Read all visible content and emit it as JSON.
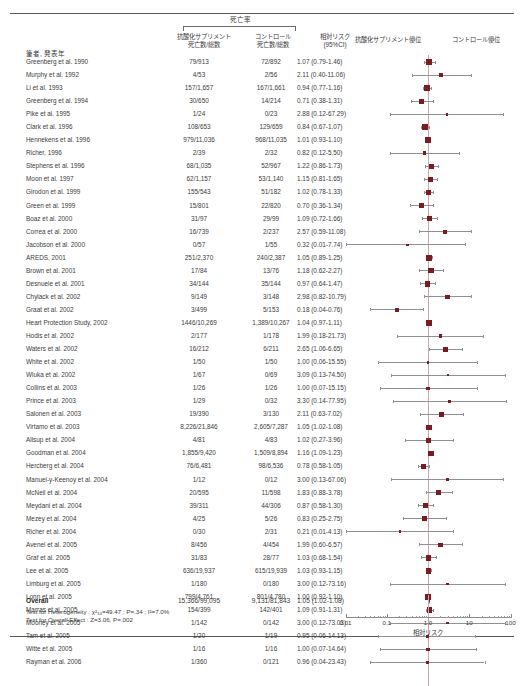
{
  "header": {
    "mortality_group": "死亡率",
    "col_supplement": "抗酸化サプリメント\n死亡数/総数",
    "col_supplement_line1": "抗酸化サプリメント",
    "col_supplement_line2": "死亡数/総数",
    "col_control_line1": "コントロール",
    "col_control_line2": "死亡数/総数",
    "col_rr_line1": "相対リスク",
    "col_rr_line2": "(95%CI)",
    "col_favors_supplement": "抗酸化サプリメント優位",
    "col_favors_control": "コントロール優位",
    "col_author": "筆者, 発表年"
  },
  "overall": {
    "label": "Overall",
    "supplement": "15,366/99,095",
    "control": "9,131/81,843",
    "rr_text": "1.05 (1.02-1.08)",
    "rr": 1.05,
    "lo": 1.02,
    "hi": 1.08
  },
  "tests": {
    "heterogeneity": "Test for Heterogeneity : χ²₃₄=49.47 ; P=.34 ; I²=7.0%",
    "overall_effect": "Test for Overall Effect : Z=3.06, P=.002"
  },
  "axis": {
    "title": "相対リスク",
    "ticks": [
      "0.01",
      "0.1",
      "1.0",
      "10",
      "100"
    ],
    "min": 0.01,
    "max": 100
  },
  "colors": {
    "marker": "#7a1b22",
    "ci_line": "#8e9296",
    "zero_line": "#c9a9ab",
    "text": "#3c3c3c",
    "rule": "#5a5a5a"
  },
  "chart_data": {
    "type": "forest",
    "title": "死亡率",
    "xlabel": "相対リスク",
    "xscale": "log",
    "xlim": [
      0.01,
      100
    ],
    "reference_line": 1.0,
    "columns": [
      "筆者, 発表年",
      "抗酸化サプリメント 死亡数/総数",
      "コントロール 死亡数/総数",
      "相対リスク (95%CI)"
    ],
    "studies": [
      {
        "author": "Greenberg et al. 1990",
        "supplement": "79/913",
        "control": "72/892",
        "rr_text": "1.07 (0.79-1.46)",
        "rr": 1.07,
        "lo": 0.79,
        "hi": 1.46
      },
      {
        "author": "Murphy et al. 1992",
        "supplement": "4/53",
        "control": "2/56",
        "rr_text": "2.11 (0.40-11.06)",
        "rr": 2.11,
        "lo": 0.4,
        "hi": 11.06
      },
      {
        "author": "Li et al. 1993",
        "supplement": "157/1,657",
        "control": "167/1,661",
        "rr_text": "0.94 (0.77-1.16)",
        "rr": 0.94,
        "lo": 0.77,
        "hi": 1.16
      },
      {
        "author": "Greenberg et al. 1994",
        "supplement": "30/650",
        "control": "14/214",
        "rr_text": "0.71 (0.38-1.31)",
        "rr": 0.71,
        "lo": 0.38,
        "hi": 1.31
      },
      {
        "author": "Pike et al. 1995",
        "supplement": "1/24",
        "control": "0/23",
        "rr_text": "2.88 (0.12-67.29)",
        "rr": 2.88,
        "lo": 0.12,
        "hi": 67.29
      },
      {
        "author": "Clark et al. 1996",
        "supplement": "108/653",
        "control": "129/659",
        "rr_text": "0.84 (0.67-1.07)",
        "rr": 0.84,
        "lo": 0.67,
        "hi": 1.07
      },
      {
        "author": "Hennekens et al. 1996",
        "supplement": "979/11,036",
        "control": "968/11,035",
        "rr_text": "1.01 (0.93-1.10)",
        "rr": 1.01,
        "lo": 0.93,
        "hi": 1.1
      },
      {
        "author": "Richer, 1996",
        "supplement": "2/39",
        "control": "2/32",
        "rr_text": "0.82 (0.12-5.50)",
        "rr": 0.82,
        "lo": 0.12,
        "hi": 5.5
      },
      {
        "author": "Stephens et al. 1996",
        "supplement": "68/1,035",
        "control": "52/967",
        "rr_text": "1.22 (0.86-1.73)",
        "rr": 1.22,
        "lo": 0.86,
        "hi": 1.73
      },
      {
        "author": "Moon et al. 1997",
        "supplement": "62/1,157",
        "control": "53/1,140",
        "rr_text": "1.15 (0.81-1.65)",
        "rr": 1.15,
        "lo": 0.81,
        "hi": 1.65
      },
      {
        "author": "Girodon et al. 1999",
        "supplement": "155/543",
        "control": "51/182",
        "rr_text": "1.02 (0.78-1.33)",
        "rr": 1.02,
        "lo": 0.78,
        "hi": 1.33
      },
      {
        "author": "Green et al. 1999",
        "supplement": "15/801",
        "control": "22/820",
        "rr_text": "0.70 (0.36-1.34)",
        "rr": 0.7,
        "lo": 0.36,
        "hi": 1.34
      },
      {
        "author": "Boaz et al. 2000",
        "supplement": "31/97",
        "control": "29/99",
        "rr_text": "1.09 (0.72-1.66)",
        "rr": 1.09,
        "lo": 0.72,
        "hi": 1.66
      },
      {
        "author": "Correa et al. 2000",
        "supplement": "16/739",
        "control": "2/237",
        "rr_text": "2.57 (0.59-11.08)",
        "rr": 2.57,
        "lo": 0.59,
        "hi": 11.08
      },
      {
        "author": "Jacobson et al. 2000",
        "supplement": "0/57",
        "control": "1/55",
        "rr_text": "0.32 (0.01-7.74)",
        "rr": 0.32,
        "lo": 0.01,
        "hi": 7.74
      },
      {
        "author": "AREDS, 2001",
        "supplement": "251/2,370",
        "control": "240/2,387",
        "rr_text": "1.05 (0.89-1.25)",
        "rr": 1.05,
        "lo": 0.89,
        "hi": 1.25
      },
      {
        "author": "Brown et al. 2001",
        "supplement": "17/84",
        "control": "13/76",
        "rr_text": "1.18 (0.62-2.27)",
        "rr": 1.18,
        "lo": 0.62,
        "hi": 2.27
      },
      {
        "author": "Desnuele et al. 2001",
        "supplement": "34/144",
        "control": "35/144",
        "rr_text": "0.97 (0.64-1.47)",
        "rr": 0.97,
        "lo": 0.64,
        "hi": 1.47
      },
      {
        "author": "Chylack et al. 2002",
        "supplement": "9/149",
        "control": "3/148",
        "rr_text": "2.98 (0.82-10.79)",
        "rr": 2.98,
        "lo": 0.82,
        "hi": 10.79
      },
      {
        "author": "Graat et al. 2002",
        "supplement": "3/499",
        "control": "5/153",
        "rr_text": "0.18 (0.04-0.76)",
        "rr": 0.18,
        "lo": 0.04,
        "hi": 0.76
      },
      {
        "author": "Heart Protection Study, 2002",
        "supplement": "1446/10,269",
        "control": "1,389/10,267",
        "rr_text": "1.04 (0.97-1.11)",
        "rr": 1.04,
        "lo": 0.97,
        "hi": 1.11
      },
      {
        "author": "Hodis et al. 2002",
        "supplement": "2/177",
        "control": "1/178",
        "rr_text": "1.99 (0.18-21.73)",
        "rr": 1.99,
        "lo": 0.18,
        "hi": 21.73
      },
      {
        "author": "Waters et al. 2002",
        "supplement": "16/212",
        "control": "6/211",
        "rr_text": "2.65 (1.06-6.65)",
        "rr": 2.65,
        "lo": 1.06,
        "hi": 6.65
      },
      {
        "author": "White et al. 2002",
        "supplement": "1/50",
        "control": "1/50",
        "rr_text": "1.00 (0.06-15.55)",
        "rr": 1.0,
        "lo": 0.06,
        "hi": 15.55
      },
      {
        "author": "Wluka et al. 2002",
        "supplement": "1/67",
        "control": "0/69",
        "rr_text": "3.09 (0.13-74.50)",
        "rr": 3.09,
        "lo": 0.13,
        "hi": 74.5
      },
      {
        "author": "Collins et al. 2003",
        "supplement": "1/26",
        "control": "1/26",
        "rr_text": "1.00 (0.07-15.15)",
        "rr": 1.0,
        "lo": 0.07,
        "hi": 15.15
      },
      {
        "author": "Prince et al. 2003",
        "supplement": "1/29",
        "control": "0/32",
        "rr_text": "3.30 (0.14-77.95)",
        "rr": 3.3,
        "lo": 0.14,
        "hi": 77.95
      },
      {
        "author": "Salonen et al. 2003",
        "supplement": "19/390",
        "control": "3/130",
        "rr_text": "2.11 (0.63-7.02)",
        "rr": 2.11,
        "lo": 0.63,
        "hi": 7.02
      },
      {
        "author": "Virtamo et al. 2003",
        "supplement": "8,226/21,846",
        "control": "2,605/7,287",
        "rr_text": "1.05 (1.02-1.08)",
        "rr": 1.05,
        "lo": 1.02,
        "hi": 1.08
      },
      {
        "author": "Allsup et al. 2004",
        "supplement": "4/81",
        "control": "4/83",
        "rr_text": "1.02 (0.27-3.96)",
        "rr": 1.02,
        "lo": 0.27,
        "hi": 3.96
      },
      {
        "author": "Goodman et al. 2004",
        "supplement": "1,855/9,420",
        "control": "1,509/8,894",
        "rr_text": "1.16 (1.09-1.23)",
        "rr": 1.16,
        "lo": 1.09,
        "hi": 1.23
      },
      {
        "author": "Hercberg et al. 2004",
        "supplement": "76/6,481",
        "control": "98/6,536",
        "rr_text": "0.78 (0.58-1.05)",
        "rr": 0.78,
        "lo": 0.58,
        "hi": 1.05
      },
      {
        "author": "Manuel-y-Keenoy et al. 2004",
        "supplement": "1/12",
        "control": "0/12",
        "rr_text": "3.00 (0.13-67.06)",
        "rr": 3.0,
        "lo": 0.13,
        "hi": 67.06
      },
      {
        "author": "McNeil et al. 2004",
        "supplement": "20/595",
        "control": "11/598",
        "rr_text": "1.83 (0.88-3.78)",
        "rr": 1.83,
        "lo": 0.88,
        "hi": 3.78
      },
      {
        "author": "Meydani et al. 2004",
        "supplement": "39/311",
        "control": "44/306",
        "rr_text": "0.87 (0.58-1.30)",
        "rr": 0.87,
        "lo": 0.58,
        "hi": 1.3
      },
      {
        "author": "Mezey et al. 2004",
        "supplement": "4/25",
        "control": "5/26",
        "rr_text": "0.83 (0.25-2.75)",
        "rr": 0.83,
        "lo": 0.25,
        "hi": 2.75
      },
      {
        "author": "Richer et al. 2004",
        "supplement": "0/30",
        "control": "2/31",
        "rr_text": "0.21 (0.01-4.13)",
        "rr": 0.21,
        "lo": 0.01,
        "hi": 4.13
      },
      {
        "author": "Avenel et al. 2005",
        "supplement": "8/456",
        "control": "4/454",
        "rr_text": "1.99 (0.60-6.57)",
        "rr": 1.99,
        "lo": 0.6,
        "hi": 6.57
      },
      {
        "author": "Graf et al. 2005",
        "supplement": "31/83",
        "control": "28/77",
        "rr_text": "1.03 (0.68-1.54)",
        "rr": 1.03,
        "lo": 0.68,
        "hi": 1.54
      },
      {
        "author": "Lee et al. 2005",
        "supplement": "636/19,937",
        "control": "615/19,939",
        "rr_text": "1.03 (0.93-1.15)",
        "rr": 1.03,
        "lo": 0.93,
        "hi": 1.15
      },
      {
        "author": "Limburg et al. 2005",
        "supplement": "1/180",
        "control": "0/180",
        "rr_text": "3.00 (0.12-73.16)",
        "rr": 3.0,
        "lo": 0.12,
        "hi": 73.16
      },
      {
        "author": "Lonn et al. 2005",
        "supplement": "799/4,761",
        "control": "801/4,780",
        "rr_text": "1.00 (0.92-1.10)",
        "rr": 1.0,
        "lo": 0.92,
        "hi": 1.1
      },
      {
        "author": "Marras et al. 2005",
        "supplement": "154/399",
        "control": "142/401",
        "rr_text": "1.09 (0.91-1.31)",
        "rr": 1.09,
        "lo": 0.91,
        "hi": 1.31
      },
      {
        "author": "Mooney et al. 2005",
        "supplement": "1/142",
        "control": "0/142",
        "rr_text": "3.00 (0.12-73.03)",
        "rr": 3.0,
        "lo": 0.12,
        "hi": 73.03
      },
      {
        "author": "Tam et al. 2005",
        "supplement": "1/20",
        "control": "1/19",
        "rr_text": "0.95 (0.06-14.13)",
        "rr": 0.95,
        "lo": 0.06,
        "hi": 14.13
      },
      {
        "author": "Witte et al. 2005",
        "supplement": "1/16",
        "control": "1/16",
        "rr_text": "1.00 (0.07-14.64)",
        "rr": 1.0,
        "lo": 0.07,
        "hi": 14.64
      },
      {
        "author": "Rayman et al. 2006",
        "supplement": "1/360",
        "control": "0/121",
        "rr_text": "0.96 (0.04-23.43)",
        "rr": 0.96,
        "lo": 0.04,
        "hi": 23.43
      }
    ]
  }
}
